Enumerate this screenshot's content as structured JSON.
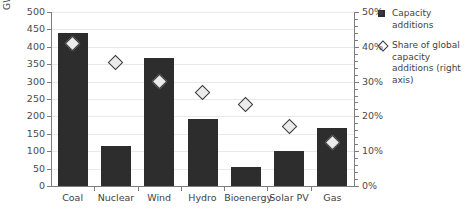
{
  "chart_data": {
    "type": "bar",
    "title": "",
    "subtitle": "",
    "xlabel": "",
    "ylabel": "GW",
    "y2label": "",
    "categories": [
      "Coal",
      "Nuclear",
      "Wind",
      "Hydro",
      "Bioenergy",
      "Solar PV",
      "Gas"
    ],
    "series": [
      {
        "name": "Capacity additions",
        "type": "bar",
        "axis": "left",
        "unit": "GW",
        "values": [
          440,
          115,
          368,
          192,
          55,
          100,
          168
        ]
      },
      {
        "name": "Share of global capacity additions (right axis)",
        "type": "scatter",
        "axis": "right",
        "unit": "%",
        "values": [
          41,
          35.5,
          30,
          27,
          23.5,
          17,
          12.5
        ]
      }
    ],
    "ylim": [
      0,
      500
    ],
    "y2lim": [
      0,
      50
    ],
    "ytick_step": 50,
    "y2tick_step": 10,
    "yticks": [
      0,
      50,
      100,
      150,
      200,
      250,
      300,
      350,
      400,
      450,
      500
    ],
    "ytick_labels": [
      "0",
      "50",
      "100",
      "150",
      "200",
      "250",
      "300",
      "350",
      "400",
      "450",
      "500"
    ],
    "y2ticks": [
      0,
      10,
      20,
      30,
      40,
      50
    ],
    "y2tick_labels": [
      "0%",
      "10%",
      "20%",
      "30%",
      "40%",
      "50%"
    ],
    "grid": true,
    "legend_position": "right",
    "bar_color": "#2d2d2d",
    "marker_color": "#ebebeb",
    "marker_edge_color": "#3a3a3a",
    "grid_color": "#e9e9e9",
    "axis_color": "#7d7d7d"
  },
  "legend": {
    "items": [
      {
        "marker": "square-marker-icon",
        "label": "Capacity additions"
      },
      {
        "marker": "diamond-marker-icon",
        "label": "Share of global capacity additions (right axis)"
      }
    ]
  }
}
